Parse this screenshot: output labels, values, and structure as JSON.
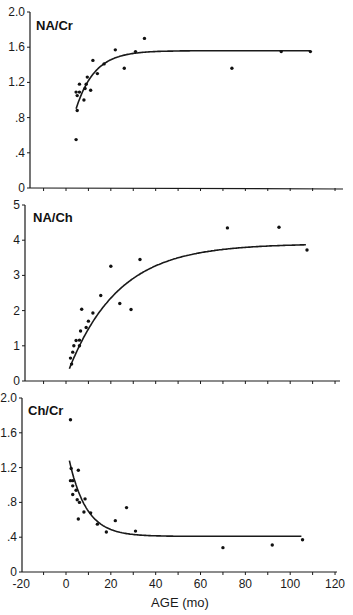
{
  "chart_data": [
    {
      "type": "scatter",
      "title": "NA/Cr",
      "xlabel": "",
      "ylabel": "",
      "xlim": [
        -20,
        120
      ],
      "ylim": [
        0,
        2.0
      ],
      "yticks": [
        "0",
        ".4",
        ".8",
        "1.2",
        "1.6",
        "2.0"
      ],
      "ytick_values": [
        0,
        0.4,
        0.8,
        1.2,
        1.6,
        2.0
      ],
      "grid": false,
      "points": [
        {
          "x": 4.5,
          "y": 0.55
        },
        {
          "x": 5,
          "y": 0.88
        },
        {
          "x": 4.5,
          "y": 1.09
        },
        {
          "x": 5,
          "y": 1.05
        },
        {
          "x": 6,
          "y": 1.09
        },
        {
          "x": 6,
          "y": 1.18
        },
        {
          "x": 8,
          "y": 1.0
        },
        {
          "x": 8.5,
          "y": 1.13
        },
        {
          "x": 9,
          "y": 1.18
        },
        {
          "x": 9.5,
          "y": 1.26
        },
        {
          "x": 11,
          "y": 1.11
        },
        {
          "x": 12,
          "y": 1.45
        },
        {
          "x": 14,
          "y": 1.3
        },
        {
          "x": 17,
          "y": 1.41
        },
        {
          "x": 22,
          "y": 1.57
        },
        {
          "x": 26,
          "y": 1.36
        },
        {
          "x": 31,
          "y": 1.55
        },
        {
          "x": 35,
          "y": 1.7
        },
        {
          "x": 74,
          "y": 1.36
        },
        {
          "x": 96,
          "y": 1.55
        },
        {
          "x": 109,
          "y": 1.55
        }
      ],
      "fit": {
        "type": "exponential_rise",
        "plateau": 1.56,
        "start_x": 4.5,
        "start_y": 0.9,
        "rate": 0.12,
        "end_x": 109
      }
    },
    {
      "type": "scatter",
      "title": "NA/Ch",
      "xlabel": "",
      "ylabel": "",
      "xlim": [
        -20,
        120
      ],
      "ylim": [
        0,
        5
      ],
      "yticks": [
        "0",
        "1",
        "2",
        "3",
        "4",
        "5"
      ],
      "ytick_values": [
        0,
        1,
        2,
        3,
        4,
        5
      ],
      "grid": false,
      "points": [
        {
          "x": 2,
          "y": 0.65
        },
        {
          "x": 2.5,
          "y": 0.48
        },
        {
          "x": 3,
          "y": 0.82
        },
        {
          "x": 3.5,
          "y": 1.0
        },
        {
          "x": 4.5,
          "y": 1.15
        },
        {
          "x": 6,
          "y": 1.16
        },
        {
          "x": 6,
          "y": 1.0
        },
        {
          "x": 6.5,
          "y": 1.42
        },
        {
          "x": 7,
          "y": 2.04
        },
        {
          "x": 9,
          "y": 1.52
        },
        {
          "x": 10,
          "y": 1.7
        },
        {
          "x": 12,
          "y": 1.93
        },
        {
          "x": 15.5,
          "y": 2.43
        },
        {
          "x": 20,
          "y": 3.26
        },
        {
          "x": 24,
          "y": 2.2
        },
        {
          "x": 29,
          "y": 2.03
        },
        {
          "x": 33,
          "y": 3.45
        },
        {
          "x": 72,
          "y": 4.35
        },
        {
          "x": 95,
          "y": 4.37
        },
        {
          "x": 107.5,
          "y": 3.72
        }
      ],
      "fit": {
        "type": "exponential_rise",
        "plateau": 3.9,
        "start_x": 1.5,
        "start_y": 0.35,
        "rate": 0.045,
        "end_x": 107
      }
    },
    {
      "type": "scatter",
      "title": "Ch/Cr",
      "xlabel": "AGE (mo)",
      "ylabel": "",
      "xlim": [
        -20,
        120
      ],
      "ylim": [
        0,
        2.0
      ],
      "xticks": [
        "-20",
        "0",
        "20",
        "40",
        "60",
        "80",
        "100",
        "120"
      ],
      "xtick_values": [
        -20,
        0,
        20,
        40,
        60,
        80,
        100,
        120
      ],
      "yticks": [
        "0",
        ".4",
        ".8",
        "1.2",
        "1.6",
        "2.0"
      ],
      "ytick_values": [
        0,
        0.4,
        0.8,
        1.2,
        1.6,
        2.0
      ],
      "grid": false,
      "points": [
        {
          "x": 2,
          "y": 1.75
        },
        {
          "x": 2.3,
          "y": 1.19
        },
        {
          "x": 2,
          "y": 1.05
        },
        {
          "x": 3,
          "y": 1.05
        },
        {
          "x": 3,
          "y": 0.99
        },
        {
          "x": 3,
          "y": 0.89
        },
        {
          "x": 4.5,
          "y": 0.94
        },
        {
          "x": 5,
          "y": 0.83
        },
        {
          "x": 5.5,
          "y": 1.17
        },
        {
          "x": 5.5,
          "y": 0.61
        },
        {
          "x": 6,
          "y": 0.8
        },
        {
          "x": 8.5,
          "y": 0.84
        },
        {
          "x": 8,
          "y": 0.69
        },
        {
          "x": 11,
          "y": 0.68
        },
        {
          "x": 14,
          "y": 0.55
        },
        {
          "x": 18,
          "y": 0.46
        },
        {
          "x": 22,
          "y": 0.59
        },
        {
          "x": 27,
          "y": 0.74
        },
        {
          "x": 31,
          "y": 0.47
        },
        {
          "x": 70,
          "y": 0.28
        },
        {
          "x": 92,
          "y": 0.31
        },
        {
          "x": 105.5,
          "y": 0.37
        }
      ],
      "fit": {
        "type": "exponential_decay",
        "plateau": 0.41,
        "start_x": 1.5,
        "start_y": 1.28,
        "rate": 0.13,
        "end_x": 105
      }
    }
  ],
  "figure": {
    "x_axis_label": "AGE (mo)",
    "panel_titles": [
      "NA/Cr",
      "NA/Ch",
      "Ch/Cr"
    ]
  }
}
